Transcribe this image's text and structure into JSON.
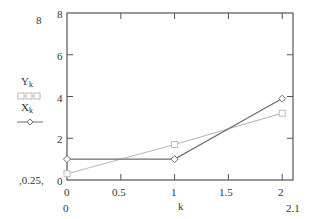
{
  "chart_data": {
    "type": "line",
    "title": "",
    "xlabel": "k",
    "ylabel": "",
    "xlim": [
      0,
      2.1
    ],
    "ylim": [
      0,
      8
    ],
    "x": [
      0,
      1,
      2
    ],
    "x_ticks": [
      "0",
      "0.5",
      "1",
      "1.5",
      "2"
    ],
    "y_ticks": [
      "0",
      "2",
      "4",
      "6",
      "8"
    ],
    "grid": false,
    "legend_position": "left",
    "series": [
      {
        "name": "Y_k",
        "values": [
          0.3,
          1.7,
          3.2
        ],
        "marker": "square",
        "color": "#bdbdbd"
      },
      {
        "name": "X_k",
        "values": [
          1.0,
          1.0,
          3.9
        ],
        "marker": "diamond",
        "color": "#6e6e6e"
      }
    ],
    "annotations": {
      "y_max_outside": "8",
      "y_min_outside": "0.25",
      "x_min_outside": "0",
      "x_max_outside": "2.1"
    }
  },
  "legend": {
    "y_label": "Y",
    "y_sub": "k",
    "x_label": "X",
    "x_sub": "k"
  },
  "axis": {
    "xlabel": "k",
    "ymax_outer": "8",
    "ymin_outer": "0.25",
    "xmin_outer": "0",
    "xmax_outer": "2.1",
    "y_tick_0": "0",
    "y_tick_2": "2",
    "y_tick_4": "4",
    "y_tick_6": "6",
    "y_tick_8": "8",
    "x_tick_0": "0",
    "x_tick_05": "0.5",
    "x_tick_1": "1",
    "x_tick_15": "1.5",
    "x_tick_2": "2"
  }
}
